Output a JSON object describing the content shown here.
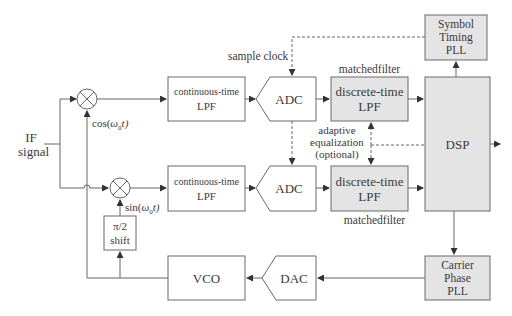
{
  "diagram": {
    "type": "block-diagram",
    "colors": {
      "line": "#555555",
      "box_border": "#6a6a6a",
      "shaded_fill": "#e4e4e4",
      "plain_fill": "#ffffff",
      "text": "#3a3a3a"
    },
    "input": {
      "line1": "IF",
      "line2": "signal"
    },
    "mixers": {
      "top": {
        "symbol": "multiply-icon",
        "osc_label_fn": "cos(",
        "osc_label_var": "ω",
        "osc_label_sub": "0",
        "osc_label_tail": "t)"
      },
      "bottom": {
        "symbol": "multiply-icon",
        "osc_label_fn": "sin(",
        "osc_label_var": "ω",
        "osc_label_sub": "0",
        "osc_label_tail": "t)"
      }
    },
    "blocks": {
      "lpf_top": {
        "line1": "continuous-time",
        "line2": "LPF"
      },
      "lpf_bottom": {
        "line1": "continuous-time",
        "line2": "LPF"
      },
      "adc_top": {
        "label": "ADC"
      },
      "adc_bottom": {
        "label": "ADC"
      },
      "dlpf_top": {
        "line1": "discrete-time",
        "line2": "LPF",
        "caption": "matchedfilter"
      },
      "dlpf_bottom": {
        "line1": "discrete-time",
        "line2": "LPF",
        "caption": "matchedfilter"
      },
      "dsp": {
        "label": "DSP"
      },
      "symbol_timing_pll": {
        "line1": "Symbol",
        "line2": "Timing",
        "line3": "PLL"
      },
      "carrier_phase_pll": {
        "line1": "Carrier",
        "line2": "Phase",
        "line3": "PLL"
      },
      "phase_shift": {
        "line1": "π/2",
        "line2": "shift"
      },
      "vco": {
        "label": "VCO"
      },
      "dac": {
        "label": "DAC"
      }
    },
    "annotations": {
      "sample_clock": "sample clock",
      "adaptive_eq_line1": "adaptive",
      "adaptive_eq_line2": "equalization",
      "adaptive_eq_line3": "(optional)"
    }
  }
}
